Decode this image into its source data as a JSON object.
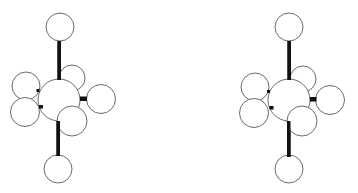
{
  "figure": {
    "views": [
      {
        "name": "left-view",
        "atoms": [
          {
            "id": "top",
            "cx": 60,
            "cy": 27,
            "r": 14
          },
          {
            "id": "upper-right",
            "cx": 72,
            "cy": 78,
            "r": 13
          },
          {
            "id": "upper-left",
            "cx": 26,
            "cy": 86,
            "r": 14
          },
          {
            "id": "lower-left",
            "cx": 25,
            "cy": 112,
            "r": 14.5
          },
          {
            "id": "central",
            "cx": 59,
            "cy": 100,
            "r": 21
          },
          {
            "id": "right",
            "cx": 101,
            "cy": 99,
            "r": 14.5
          },
          {
            "id": "lower-right",
            "cx": 72,
            "cy": 121,
            "r": 15
          },
          {
            "id": "bottom",
            "cx": 58,
            "cy": 169,
            "r": 14
          }
        ],
        "bonds": [
          {
            "id": "top-bond",
            "x": 57.5,
            "y": 41,
            "w": 3.5,
            "h": 39
          },
          {
            "id": "bottom-bond",
            "x": 56.5,
            "y": 121,
            "w": 3.5,
            "h": 35
          },
          {
            "id": "right-bond",
            "x": 80,
            "y": 96.5,
            "w": 7,
            "h": 4.5
          },
          {
            "id": "left-upper-stub",
            "x": 36.5,
            "y": 89,
            "w": 3,
            "h": 3
          },
          {
            "id": "left-lower-stub",
            "x": 39,
            "y": 105,
            "w": 4,
            "h": 3.5
          }
        ]
      },
      {
        "name": "right-view",
        "atoms": [
          {
            "id": "top",
            "cx": 289,
            "cy": 27,
            "r": 14
          },
          {
            "id": "upper-right",
            "cx": 303,
            "cy": 79,
            "r": 13
          },
          {
            "id": "upper-left",
            "cx": 255,
            "cy": 87,
            "r": 14
          },
          {
            "id": "lower-left",
            "cx": 254,
            "cy": 113,
            "r": 14.5
          },
          {
            "id": "central",
            "cx": 289,
            "cy": 100,
            "r": 21
          },
          {
            "id": "right",
            "cx": 330,
            "cy": 100,
            "r": 14.5
          },
          {
            "id": "lower-right",
            "cx": 302,
            "cy": 121,
            "r": 15
          },
          {
            "id": "bottom",
            "cx": 289,
            "cy": 169,
            "r": 14
          }
        ],
        "bonds": [
          {
            "id": "top-bond",
            "x": 287.5,
            "y": 41,
            "w": 3.5,
            "h": 39
          },
          {
            "id": "bottom-bond",
            "x": 287,
            "y": 121,
            "w": 3.5,
            "h": 36
          },
          {
            "id": "right-bond",
            "x": 310,
            "y": 97,
            "w": 6.5,
            "h": 4.5
          },
          {
            "id": "left-upper-stub",
            "x": 267,
            "y": 90,
            "w": 3,
            "h": 3
          },
          {
            "id": "left-lower-stub",
            "x": 269.5,
            "y": 106,
            "w": 4,
            "h": 3.5
          }
        ]
      }
    ],
    "colors": {
      "background": "#ffffff",
      "atom_fill": "#ffffff",
      "atom_stroke": "#5a5a5a",
      "bond": "#111111"
    }
  }
}
